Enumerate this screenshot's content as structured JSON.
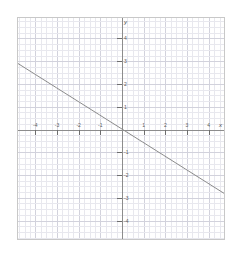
{
  "chart_data": {
    "type": "line",
    "title": "",
    "subtitle": "",
    "xlabel": "x",
    "ylabel": "y",
    "xlim": [
      -4.8,
      4.8
    ],
    "ylim": [
      -4.9,
      4.9
    ],
    "grid": true,
    "minor_grid": true,
    "minor_ticks_per_unit": 4,
    "legend": false,
    "legend_position": "none",
    "x_ticks": [
      -4,
      -3,
      -2,
      -1,
      1,
      2,
      3,
      4
    ],
    "y_ticks": [
      -4,
      -3,
      -2,
      -1,
      1,
      2,
      3,
      4
    ],
    "x_tick_labels": [
      "-4",
      "-3",
      "-2",
      "-1",
      "1",
      "2",
      "3",
      "4"
    ],
    "y_tick_labels": [
      "-4",
      "-3",
      "-2",
      "-1",
      "1",
      "2",
      "3",
      "4"
    ],
    "series": [
      {
        "name": "y = -0.6x",
        "slope": -0.6,
        "intercept": 0,
        "color": "#8a8a8a",
        "width": 1,
        "x": [
          -4.8,
          4.8
        ],
        "values": [
          2.88,
          -2.88
        ],
        "points": [
          [
            -4.8,
            2.88
          ],
          [
            -4,
            2.4
          ],
          [
            -3,
            1.8
          ],
          [
            -2,
            1.2
          ],
          [
            -1,
            0.6
          ],
          [
            0,
            0
          ],
          [
            1,
            -0.6
          ],
          [
            2,
            -1.2
          ],
          [
            3,
            -1.8
          ],
          [
            4,
            -2.4
          ],
          [
            4.8,
            -2.88
          ]
        ]
      }
    ],
    "axis_colors": {
      "axis": "#8c8c8c",
      "grid_major": "#d2d2dc",
      "grid_minor": "#e8e8ee",
      "frame": "#c8c8c8",
      "text": "#5a5a5a",
      "background": "#ffffff"
    }
  }
}
